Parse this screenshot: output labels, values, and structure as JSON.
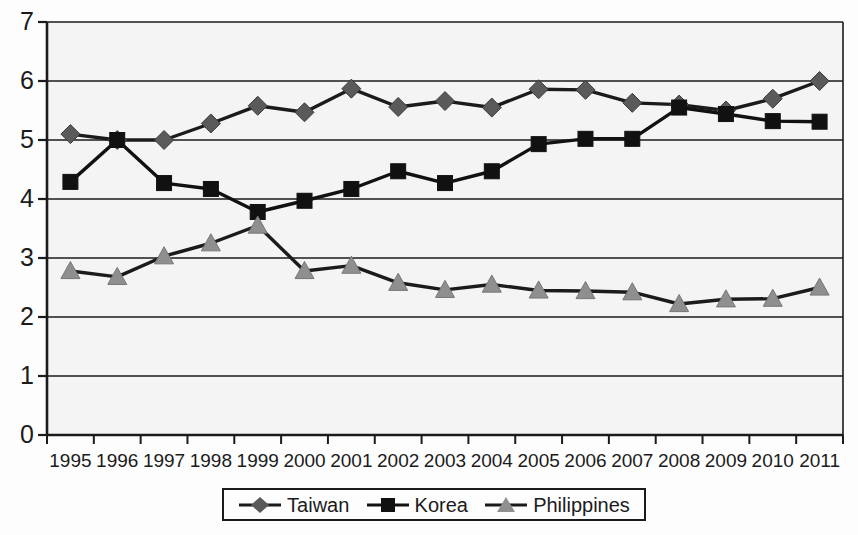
{
  "chart_data": {
    "type": "line",
    "title": "",
    "subtitle": "",
    "xlabel": "",
    "ylabel": "",
    "categories": [
      "1995",
      "1996",
      "1997",
      "1998",
      "1999",
      "2000",
      "2001",
      "2002",
      "2003",
      "2004",
      "2005",
      "2006",
      "2007",
      "2008",
      "2009",
      "2010",
      "2011"
    ],
    "ylim": [
      0,
      7
    ],
    "yticks": [
      0,
      1,
      2,
      3,
      4,
      5,
      6,
      7
    ],
    "ytick_labels": [
      "0",
      "1",
      "2",
      "3",
      "4",
      "5",
      "6",
      "7"
    ],
    "grid": true,
    "grid_axis": "y",
    "legend_position": "bottom",
    "series": [
      {
        "name": "Taiwan",
        "marker": "diamond",
        "color": "#5a5a5a",
        "line_color": "#1b1b1b",
        "values": [
          5.1,
          5.0,
          5.0,
          5.28,
          5.58,
          5.47,
          5.87,
          5.56,
          5.66,
          5.55,
          5.86,
          5.85,
          5.63,
          5.6,
          5.5,
          5.7,
          6.0
        ]
      },
      {
        "name": "Korea",
        "marker": "square",
        "color": "#111111",
        "line_color": "#111111",
        "values": [
          4.29,
          5.0,
          4.27,
          4.17,
          3.78,
          3.97,
          4.17,
          4.47,
          4.27,
          4.47,
          4.93,
          5.02,
          5.02,
          5.55,
          5.44,
          5.32,
          5.31
        ]
      },
      {
        "name": "Philippines",
        "marker": "triangle",
        "color": "#8f8f8f",
        "line_color": "#1b1b1b",
        "values": [
          2.78,
          2.68,
          3.03,
          3.25,
          3.55,
          2.78,
          2.87,
          2.58,
          2.46,
          2.55,
          2.45,
          2.44,
          2.42,
          2.22,
          2.3,
          2.31,
          2.5
        ]
      }
    ]
  },
  "legend": {
    "entries": [
      {
        "label": "Taiwan"
      },
      {
        "label": "Korea"
      },
      {
        "label": "Philippines"
      }
    ]
  }
}
